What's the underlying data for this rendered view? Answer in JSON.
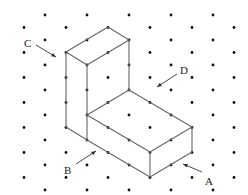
{
  "figure": {
    "type": "isometric dot-grid drawing",
    "colors": {
      "dot": "#111111",
      "edge": "#666666",
      "label": "#222222",
      "background": "#ffffff"
    },
    "grid": {
      "dx": 21,
      "dy": 12.5,
      "x0": 24,
      "y0": 15,
      "cols": 11,
      "rows": 15
    },
    "labels": [
      {
        "id": "A",
        "text": "A",
        "x": 205,
        "y": 176,
        "arrow_from": [
          202,
          172
        ],
        "arrow_to": [
          183,
          164
        ]
      },
      {
        "id": "B",
        "text": "B",
        "x": 64,
        "y": 165,
        "arrow_from": [
          76,
          164
        ],
        "arrow_to": [
          96,
          151
        ]
      },
      {
        "id": "C",
        "text": "C",
        "x": 24,
        "y": 38,
        "arrow_from": [
          36,
          45
        ],
        "arrow_to": [
          56,
          57
        ]
      },
      {
        "id": "D",
        "text": "D",
        "x": 180,
        "y": 65,
        "arrow_from": [
          177,
          74
        ],
        "arrow_to": [
          157,
          87
        ]
      }
    ],
    "edges": [
      [
        [
          66,
          52
        ],
        [
          108,
          27
        ]
      ],
      [
        [
          108,
          27
        ],
        [
          129,
          40
        ]
      ],
      [
        [
          129,
          40
        ],
        [
          87,
          65
        ]
      ],
      [
        [
          87,
          65
        ],
        [
          66,
          52
        ]
      ],
      [
        [
          66,
          52
        ],
        [
          66,
          127
        ]
      ],
      [
        [
          87,
          65
        ],
        [
          87,
          140
        ]
      ],
      [
        [
          129,
          40
        ],
        [
          129,
          90
        ]
      ],
      [
        [
          87,
          115
        ],
        [
          129,
          90
        ]
      ],
      [
        [
          129,
          90
        ],
        [
          192,
          127
        ]
      ],
      [
        [
          87,
          115
        ],
        [
          150,
          152
        ]
      ],
      [
        [
          150,
          152
        ],
        [
          192,
          127
        ]
      ],
      [
        [
          87,
          140
        ],
        [
          150,
          177
        ]
      ],
      [
        [
          150,
          152
        ],
        [
          150,
          177
        ]
      ],
      [
        [
          192,
          127
        ],
        [
          192,
          152
        ]
      ],
      [
        [
          150,
          177
        ],
        [
          192,
          152
        ]
      ],
      [
        [
          66,
          127
        ],
        [
          87,
          140
        ]
      ]
    ]
  }
}
